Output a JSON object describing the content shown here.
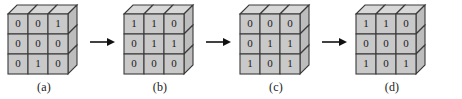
{
  "figure": {
    "name": "binary-cube-grid-sequence",
    "background_color": "#ffffff",
    "face_color": "#c9c9c9",
    "top_color": "#d8d8d8",
    "side_color": "#bdbdbd",
    "edge_color": "#3a3a3a",
    "digit_color": "#1a1a1a",
    "arrow_color": "#111111",
    "arrow_glyph": "right-arrow"
  },
  "steps": [
    {
      "caption": "(a)",
      "rows": [
        [
          "0",
          "0",
          "1"
        ],
        [
          "0",
          "0",
          "0"
        ],
        [
          "0",
          "1",
          "0"
        ]
      ]
    },
    {
      "caption": "(b)",
      "rows": [
        [
          "1",
          "1",
          "0"
        ],
        [
          "0",
          "1",
          "1"
        ],
        [
          "0",
          "0",
          "0"
        ]
      ]
    },
    {
      "caption": "(c)",
      "rows": [
        [
          "0",
          "0",
          "0"
        ],
        [
          "0",
          "1",
          "1"
        ],
        [
          "1",
          "0",
          "1"
        ]
      ]
    },
    {
      "caption": "(d)",
      "rows": [
        [
          "1",
          "1",
          "0"
        ],
        [
          "0",
          "0",
          "0"
        ],
        [
          "1",
          "0",
          "1"
        ]
      ]
    }
  ],
  "arrows": [
    {
      "label": "arrow-a-to-b"
    },
    {
      "label": "arrow-b-to-c"
    },
    {
      "label": "arrow-c-to-d"
    }
  ]
}
